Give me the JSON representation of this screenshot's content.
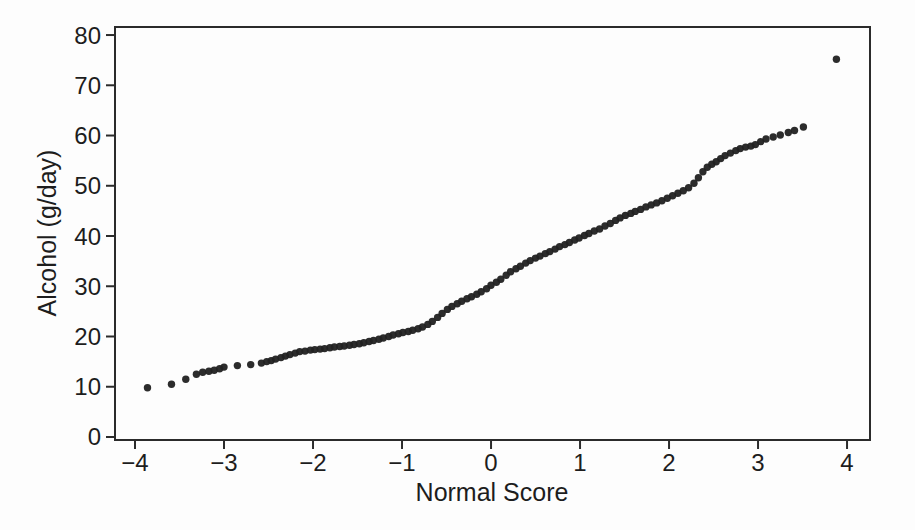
{
  "figure": {
    "background_color": "#fdfdfd",
    "point_color": "#212121",
    "axis_color": "#2b2b2b",
    "text_color": "#1d1d1d"
  },
  "chart_data": {
    "type": "scatter",
    "title": "",
    "xlabel": "Normal Score",
    "ylabel": "Alcohol (g/day)",
    "xlim": [
      -4.225,
      4.258
    ],
    "ylim": [
      -0.6,
      81.6
    ],
    "xticks": [
      -4,
      -3,
      -2,
      -1,
      0,
      1,
      2,
      3,
      4
    ],
    "yticks": [
      0,
      10,
      20,
      30,
      40,
      50,
      60,
      70,
      80
    ],
    "grid": false,
    "legend": null,
    "marker": {
      "shape": "circle",
      "radius_px": 3.7
    },
    "points": [
      [
        -3.86,
        9.8
      ],
      [
        -3.59,
        10.5
      ],
      [
        -3.43,
        11.5
      ],
      [
        -3.31,
        12.5
      ],
      [
        -3.24,
        12.9
      ],
      [
        -3.17,
        13.1
      ],
      [
        -3.11,
        13.3
      ],
      [
        -3.05,
        13.6
      ],
      [
        -3.0,
        13.9
      ],
      [
        -2.85,
        14.2
      ],
      [
        -2.7,
        14.4
      ],
      [
        -2.58,
        14.7
      ],
      [
        -2.52,
        15.0
      ],
      [
        -2.47,
        15.2
      ],
      [
        -2.42,
        15.5
      ],
      [
        -2.36,
        15.8
      ],
      [
        -2.31,
        16.1
      ],
      [
        -2.26,
        16.4
      ],
      [
        -2.2,
        16.7
      ],
      [
        -2.15,
        17.0
      ],
      [
        -2.09,
        17.1
      ],
      [
        -2.03,
        17.3
      ],
      [
        -1.98,
        17.4
      ],
      [
        -1.92,
        17.5
      ],
      [
        -1.87,
        17.6
      ],
      [
        -1.81,
        17.75
      ],
      [
        -1.76,
        17.9
      ],
      [
        -1.7,
        18.0
      ],
      [
        -1.65,
        18.1
      ],
      [
        -1.59,
        18.25
      ],
      [
        -1.54,
        18.4
      ],
      [
        -1.48,
        18.55
      ],
      [
        -1.43,
        18.75
      ],
      [
        -1.37,
        19.0
      ],
      [
        -1.32,
        19.2
      ],
      [
        -1.26,
        19.45
      ],
      [
        -1.21,
        19.7
      ],
      [
        -1.15,
        20.0
      ],
      [
        -1.1,
        20.3
      ],
      [
        -1.04,
        20.55
      ],
      [
        -0.99,
        20.8
      ],
      [
        -0.93,
        21.0
      ],
      [
        -0.88,
        21.25
      ],
      [
        -0.82,
        21.55
      ],
      [
        -0.77,
        21.9
      ],
      [
        -0.71,
        22.4
      ],
      [
        -0.66,
        23.0
      ],
      [
        -0.6,
        23.8
      ],
      [
        -0.55,
        24.6
      ],
      [
        -0.49,
        25.4
      ],
      [
        -0.44,
        26.0
      ],
      [
        -0.38,
        26.5
      ],
      [
        -0.33,
        27.0
      ],
      [
        -0.27,
        27.5
      ],
      [
        -0.22,
        27.9
      ],
      [
        -0.16,
        28.4
      ],
      [
        -0.11,
        28.9
      ],
      [
        -0.05,
        29.5
      ],
      [
        0.0,
        30.2
      ],
      [
        0.06,
        30.8
      ],
      [
        0.11,
        31.4
      ],
      [
        0.17,
        32.2
      ],
      [
        0.22,
        32.9
      ],
      [
        0.28,
        33.5
      ],
      [
        0.33,
        34.0
      ],
      [
        0.39,
        34.6
      ],
      [
        0.44,
        35.1
      ],
      [
        0.5,
        35.6
      ],
      [
        0.55,
        36.0
      ],
      [
        0.61,
        36.5
      ],
      [
        0.66,
        36.9
      ],
      [
        0.72,
        37.4
      ],
      [
        0.77,
        37.9
      ],
      [
        0.83,
        38.3
      ],
      [
        0.88,
        38.7
      ],
      [
        0.94,
        39.2
      ],
      [
        0.99,
        39.6
      ],
      [
        1.05,
        40.1
      ],
      [
        1.1,
        40.5
      ],
      [
        1.16,
        41.0
      ],
      [
        1.22,
        41.4
      ],
      [
        1.28,
        42.0
      ],
      [
        1.34,
        42.5
      ],
      [
        1.4,
        43.1
      ],
      [
        1.45,
        43.6
      ],
      [
        1.51,
        44.1
      ],
      [
        1.57,
        44.5
      ],
      [
        1.62,
        44.9
      ],
      [
        1.68,
        45.3
      ],
      [
        1.74,
        45.8
      ],
      [
        1.8,
        46.2
      ],
      [
        1.86,
        46.6
      ],
      [
        1.92,
        47.0
      ],
      [
        1.98,
        47.5
      ],
      [
        2.04,
        48.0
      ],
      [
        2.1,
        48.5
      ],
      [
        2.16,
        49.0
      ],
      [
        2.22,
        49.6
      ],
      [
        2.28,
        50.5
      ],
      [
        2.33,
        51.6
      ],
      [
        2.38,
        52.8
      ],
      [
        2.43,
        53.7
      ],
      [
        2.48,
        54.3
      ],
      [
        2.53,
        54.8
      ],
      [
        2.58,
        55.4
      ],
      [
        2.63,
        56.0
      ],
      [
        2.69,
        56.5
      ],
      [
        2.75,
        57.0
      ],
      [
        2.8,
        57.4
      ],
      [
        2.86,
        57.7
      ],
      [
        2.92,
        57.9
      ],
      [
        2.97,
        58.2
      ],
      [
        3.03,
        58.8
      ],
      [
        3.09,
        59.3
      ],
      [
        3.17,
        59.7
      ],
      [
        3.25,
        60.1
      ],
      [
        3.34,
        60.6
      ],
      [
        3.41,
        61.0
      ],
      [
        3.51,
        61.7
      ],
      [
        3.88,
        75.2
      ]
    ]
  }
}
